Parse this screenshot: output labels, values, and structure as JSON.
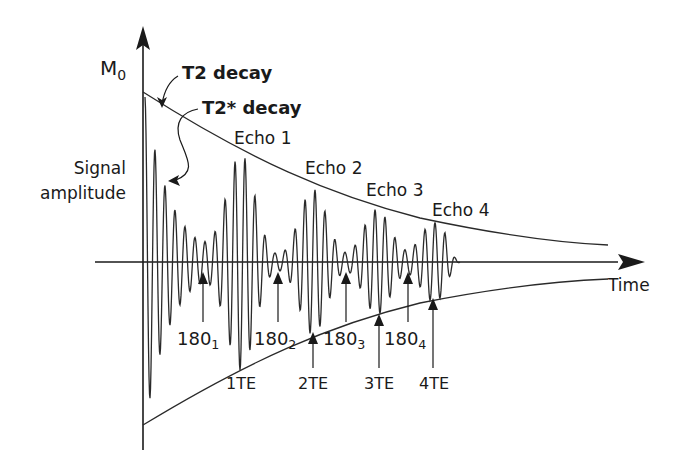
{
  "diagram": {
    "axes": {
      "y_label_main": "M",
      "y_label_sub": "0",
      "x_label": "Time"
    },
    "annotations": {
      "t2_decay": "T2 decay",
      "t2star_decay": "T2* decay",
      "signal_amplitude_line1": "Signal",
      "signal_amplitude_line2": "amplitude"
    },
    "echoes": [
      {
        "label": "Echo 1"
      },
      {
        "label": "Echo 2"
      },
      {
        "label": "Echo 3"
      },
      {
        "label": "Echo 4"
      }
    ],
    "pulses": [
      {
        "main": "180",
        "sub": "1"
      },
      {
        "main": "180",
        "sub": "2"
      },
      {
        "main": "180",
        "sub": "3"
      },
      {
        "main": "180",
        "sub": "4"
      }
    ],
    "echo_times": [
      {
        "label": "1TE"
      },
      {
        "label": "2TE"
      },
      {
        "label": "3TE"
      },
      {
        "label": "4TE"
      }
    ],
    "colors": {
      "line": "#2a2a2a",
      "background": "#ffffff"
    }
  }
}
